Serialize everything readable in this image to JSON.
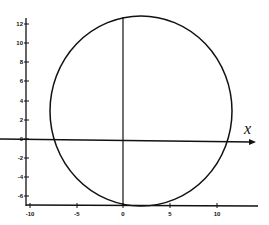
{
  "chart_data": {
    "type": "line",
    "title": "",
    "xlabel": "x",
    "ylabel": "",
    "xlim": [
      -10,
      14
    ],
    "ylim": [
      -7,
      13
    ],
    "x_ticks": [
      "-10",
      "-5",
      "0",
      "5",
      "10"
    ],
    "y_ticks": [
      "12",
      "10",
      "8",
      "6",
      "4",
      "2",
      "0",
      "-2",
      "-4",
      "-6"
    ],
    "grid": false,
    "series": [
      {
        "name": "circle",
        "shape": "circle",
        "center": [
          2,
          3
        ],
        "radius": 10
      },
      {
        "name": "vertical line x=0",
        "x": [
          0,
          0
        ],
        "y": [
          -7,
          13
        ]
      },
      {
        "name": "x-axis line y=0",
        "x": [
          -10,
          13
        ],
        "y": [
          0,
          0
        ]
      }
    ]
  },
  "axes": {
    "x_label": "x",
    "x_ticks": [
      {
        "label": "-10",
        "px": 30
      },
      {
        "label": "-5",
        "px": 77
      },
      {
        "label": "0",
        "px": 123
      },
      {
        "label": "5",
        "px": 170
      },
      {
        "label": "10",
        "px": 217
      }
    ],
    "y_ticks": [
      {
        "label": "12",
        "py": 24
      },
      {
        "label": "10",
        "py": 43
      },
      {
        "label": "8",
        "py": 62
      },
      {
        "label": "6",
        "py": 81
      },
      {
        "label": "4",
        "py": 101
      },
      {
        "label": "2",
        "py": 120
      },
      {
        "label": "0",
        "py": 139
      },
      {
        "label": "-2",
        "py": 158
      },
      {
        "label": "-4",
        "py": 177
      },
      {
        "label": "-6",
        "py": 196
      }
    ]
  },
  "colors": {
    "ink": "#111111",
    "background": "#ffffff"
  }
}
